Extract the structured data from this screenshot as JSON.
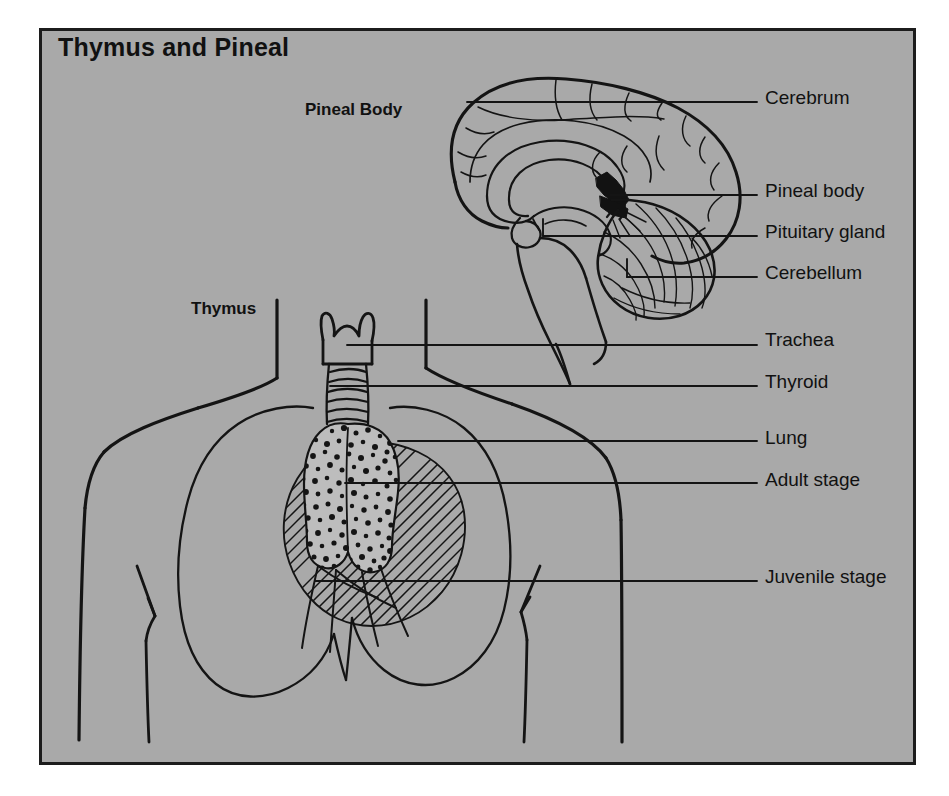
{
  "figure": {
    "title": "Thymus and Pineal",
    "background_color": "#a9a9a9",
    "frame_color": "#1c1c1c",
    "page_color": "#ffffff",
    "ink_color": "#111111"
  },
  "section_headings": [
    {
      "key": "pineal",
      "label": "Pineal Body"
    },
    {
      "key": "thymus",
      "label": "Thymus"
    }
  ],
  "callouts": [
    {
      "key": "cerebrum",
      "label": "Cerebrum",
      "label_y": 88,
      "leader_y": 102,
      "leader_x_start": 467
    },
    {
      "key": "pineal_body",
      "label": "Pineal body",
      "label_y": 181,
      "leader_y": 195,
      "leader_x_start": 610
    },
    {
      "key": "pituitary_gland",
      "label": "Pituitary gland",
      "label_y": 222,
      "leader_y": 236,
      "leader_x_start": 543
    },
    {
      "key": "cerebellum",
      "label": "Cerebellum",
      "label_y": 263,
      "leader_y": 277,
      "leader_x_start": 627
    },
    {
      "key": "trachea",
      "label": "Trachea",
      "label_y": 330,
      "leader_y": 345,
      "leader_x_start": 347
    },
    {
      "key": "thyroid",
      "label": "Thyroid",
      "label_y": 372,
      "leader_y": 386,
      "leader_x_start": 330
    },
    {
      "key": "lung",
      "label": "Lung",
      "label_y": 428,
      "leader_y": 441,
      "leader_x_start": 398
    },
    {
      "key": "adult_stage",
      "label": "Adult stage",
      "label_y": 470,
      "leader_y": 483,
      "leader_x_start": 345
    },
    {
      "key": "juvenile_stage",
      "label": "Juvenile stage",
      "label_y": 567,
      "leader_y": 581,
      "leader_x_start": 315
    }
  ],
  "anatomy_parts": [
    {
      "key": "brain-midsagittal",
      "name": "Midsagittal brain section"
    },
    {
      "key": "cerebrum-outline",
      "name": "Cerebrum"
    },
    {
      "key": "corpus-callosum",
      "name": "Corpus callosum"
    },
    {
      "key": "pineal-gland",
      "name": "Pineal gland (solid black)"
    },
    {
      "key": "pituitary-gland",
      "name": "Pituitary gland"
    },
    {
      "key": "cerebellum",
      "name": "Cerebellum"
    },
    {
      "key": "brainstem",
      "name": "Brainstem and spinal cord"
    },
    {
      "key": "torso-outline",
      "name": "Head, neck, shoulders and torso outline"
    },
    {
      "key": "larynx",
      "name": "Larynx / thyroid cartilage"
    },
    {
      "key": "trachea",
      "name": "Trachea with cartilage rings"
    },
    {
      "key": "thymus-adult",
      "name": "Adult thymus (stippled)"
    },
    {
      "key": "thymus-juvenile",
      "name": "Juvenile thymus (hatched)"
    },
    {
      "key": "lung-left",
      "name": "Left lung outline"
    },
    {
      "key": "lung-right",
      "name": "Right lung outline"
    }
  ]
}
